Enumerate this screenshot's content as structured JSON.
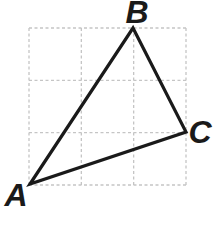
{
  "figure": {
    "background": "#ffffff",
    "grid": {
      "columns": 3,
      "rows": 3,
      "x": 29,
      "y": 28,
      "width": 157,
      "height": 157,
      "color": "#c5c5c5",
      "dash": "3 2.5",
      "stroke_width": 1.3
    },
    "triangle": {
      "stroke": "#1a1a1a",
      "stroke_width": 3.2,
      "fill": "none",
      "vertices": [
        {
          "label": "A",
          "x": 30,
          "y": 184,
          "grid": [
            0,
            0
          ]
        },
        {
          "label": "B",
          "x": 133,
          "y": 28,
          "grid": [
            2,
            3
          ]
        },
        {
          "label": "C",
          "x": 186,
          "y": 132,
          "grid": [
            3,
            1
          ]
        }
      ]
    },
    "labels": {
      "A": {
        "text": "A",
        "x": 16,
        "y": 195
      },
      "B": {
        "text": "B",
        "x": 137,
        "y": 12
      },
      "C": {
        "text": "C",
        "x": 200,
        "y": 132
      }
    }
  }
}
